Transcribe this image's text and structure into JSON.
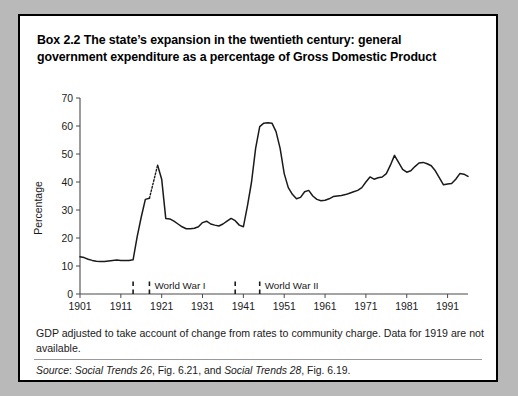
{
  "box": {
    "label": "Box 2.2",
    "title": "Box 2.2  The state’s expansion in the twentieth century: general government expenditure as a percentage of Gross Domestic Product",
    "note": "GDP adjusted to take account of change from rates to community charge. Data for 1919 are not available.",
    "source_prefix": "Source",
    "source_sep": ": ",
    "source_pub1": "Social Trends 26",
    "source_mid1": ", Fig. 6.21, and ",
    "source_pub2": "Social Trends 28",
    "source_mid2": ", Fig. 6.19.",
    "source_full": "Source: Social Trends 26, Fig. 6.21, and Social Trends 28, Fig. 6.19.",
    "border_color": "#000000",
    "page_background": "#b9b9b9",
    "panel_background": "#ffffff"
  },
  "chart_data": {
    "type": "line",
    "title": "",
    "xlabel": "",
    "ylabel": "Percentage",
    "xlim": [
      1901,
      1996
    ],
    "ylim": [
      0,
      70
    ],
    "grid": false,
    "legend": "none",
    "line_color": "#1a1a1a",
    "axis_color": "#4a4a4a",
    "yticks": [
      0,
      10,
      20,
      30,
      40,
      50,
      60,
      70
    ],
    "ytick_labels": [
      "0",
      "10",
      "20",
      "30",
      "40",
      "50",
      "60",
      "70"
    ],
    "xticks": [
      1901,
      1911,
      1921,
      1931,
      1941,
      1951,
      1961,
      1971,
      1981,
      1991
    ],
    "xtick_labels": [
      "1901",
      "1911",
      "1921",
      "1931",
      "1941",
      "1951",
      "1961",
      "1971",
      "1981",
      "1991"
    ],
    "annotations": [
      {
        "text": "World War I",
        "start_year": 1914,
        "end_year": 1918,
        "style": "dashed-vertical"
      },
      {
        "text": "World War II",
        "start_year": 1939,
        "end_year": 1945,
        "style": "dashed-vertical"
      }
    ],
    "gap_note": "1919 missing — drawn dotted",
    "gap_years": [
      1918,
      1920
    ],
    "x": [
      1901,
      1902,
      1903,
      1904,
      1905,
      1906,
      1907,
      1908,
      1909,
      1910,
      1911,
      1912,
      1913,
      1914,
      1915,
      1916,
      1917,
      1918,
      1920,
      1921,
      1922,
      1923,
      1924,
      1925,
      1926,
      1927,
      1928,
      1929,
      1930,
      1931,
      1932,
      1933,
      1934,
      1935,
      1936,
      1937,
      1938,
      1939,
      1940,
      1941,
      1942,
      1943,
      1944,
      1945,
      1946,
      1947,
      1948,
      1949,
      1950,
      1951,
      1952,
      1953,
      1954,
      1955,
      1956,
      1957,
      1958,
      1959,
      1960,
      1961,
      1962,
      1963,
      1964,
      1965,
      1966,
      1967,
      1968,
      1969,
      1970,
      1971,
      1972,
      1973,
      1974,
      1975,
      1976,
      1977,
      1978,
      1979,
      1980,
      1981,
      1982,
      1983,
      1984,
      1985,
      1986,
      1987,
      1988,
      1989,
      1990,
      1991,
      1992,
      1993,
      1994,
      1995,
      1996
    ],
    "values": [
      13.3,
      13.0,
      12.4,
      12.0,
      11.7,
      11.6,
      11.6,
      11.8,
      12.0,
      12.1,
      12.0,
      12.0,
      12.0,
      12.2,
      20.5,
      27.5,
      33.8,
      34.2,
      46.0,
      41.0,
      27.0,
      26.8,
      26.0,
      25.0,
      24.0,
      23.3,
      23.3,
      23.5,
      24.0,
      25.5,
      26.0,
      25.0,
      24.6,
      24.3,
      25.0,
      26.0,
      27.0,
      26.2,
      24.6,
      24.0,
      31.5,
      40.0,
      52.0,
      59.8,
      61.0,
      61.2,
      61.0,
      58.0,
      52.0,
      43.0,
      38.0,
      35.6,
      34.0,
      34.5,
      36.5,
      37.0,
      35.0,
      33.8,
      33.3,
      33.5,
      34.0,
      34.8,
      35.0,
      35.2,
      35.5,
      36.0,
      36.5,
      37.0,
      38.0,
      40.0,
      41.8,
      41.0,
      41.5,
      41.8,
      43.0,
      46.0,
      49.5,
      47.0,
      44.5,
      43.5,
      44.0,
      45.5,
      46.8,
      47.0,
      46.5,
      45.8,
      44.0,
      41.5,
      39.0,
      39.3,
      39.5,
      41.0,
      43.0,
      42.8,
      42.0
    ]
  }
}
